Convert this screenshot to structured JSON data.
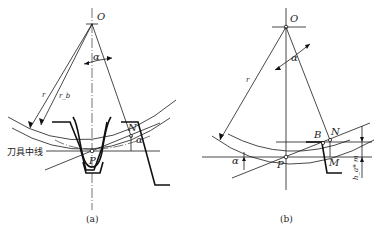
{
  "figure_a": {
    "caption": "(a)",
    "center_label": "O",
    "angle_label": "α",
    "radius_label": "r",
    "base_radius_label": "r_b",
    "pitch_point_label": "P",
    "tangent_point_label": "N",
    "angle_label_2": "α",
    "tool_centerline_label": "刀具中线"
  },
  "figure_b": {
    "caption": "(b)",
    "center_label": "O",
    "angle_label": "α",
    "radius_label": "r",
    "pitch_point_label": "P",
    "point_b_label": "B",
    "tangent_point_label": "N",
    "point_m_label": "M",
    "angle_label_2": "α",
    "dimension_label": "h_a* m"
  }
}
